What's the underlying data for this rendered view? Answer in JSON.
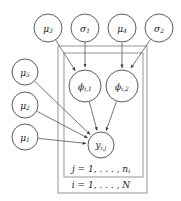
{
  "figure": {
    "type": "probabilistic-graphical-model",
    "title": "",
    "background_color": "#ffffff",
    "node_stroke_color": "#4a4a4a",
    "plate_stroke_color": "#8c8c8c",
    "edge_color": "#555555",
    "text_color": "#1a1a1a"
  },
  "nodes": [
    {
      "id": "mu3",
      "base": "μ",
      "sub": "3",
      "label": "μ₃",
      "cx": 48,
      "cy": 28,
      "r": 14,
      "shape": "circle",
      "observed": false
    },
    {
      "id": "sig1",
      "base": "σ",
      "sub": "1",
      "label": "σ₁",
      "cx": 85,
      "cy": 28,
      "r": 14,
      "shape": "circle",
      "observed": false
    },
    {
      "id": "mu4",
      "base": "μ",
      "sub": "4",
      "label": "μ₄",
      "cx": 122,
      "cy": 28,
      "r": 14,
      "shape": "circle",
      "observed": false
    },
    {
      "id": "sig2",
      "base": "σ",
      "sub": "2",
      "label": "σ₂",
      "cx": 159,
      "cy": 28,
      "r": 14,
      "shape": "circle",
      "observed": false
    },
    {
      "id": "mu5",
      "base": "μ",
      "sub": "5",
      "label": "μ₅",
      "cx": 25,
      "cy": 72,
      "r": 13,
      "shape": "circle",
      "observed": false
    },
    {
      "id": "mu2",
      "base": "μ",
      "sub": "2",
      "label": "μ₂",
      "cx": 25,
      "cy": 105,
      "r": 13,
      "shape": "circle",
      "observed": false
    },
    {
      "id": "mu1",
      "base": "μ",
      "sub": "1",
      "label": "μ₁",
      "cx": 25,
      "cy": 137,
      "r": 13,
      "shape": "circle",
      "observed": false
    },
    {
      "id": "phi1",
      "base": "ϕ",
      "sub": "i,1",
      "label": "ϕi,1",
      "cx": 85,
      "cy": 86,
      "r": 16,
      "shape": "circle",
      "observed": false
    },
    {
      "id": "phi2",
      "base": "ϕ",
      "sub": "i,2",
      "label": "ϕi,2",
      "cx": 122,
      "cy": 86,
      "r": 16,
      "shape": "circle",
      "observed": false
    },
    {
      "id": "y",
      "base": "y",
      "sub": "i,j",
      "label": "yi,j",
      "cx": 101,
      "cy": 145,
      "r": 13,
      "shape": "circle",
      "observed": false
    }
  ],
  "edges": [
    {
      "from": "mu3",
      "to": "phi1",
      "arrow": true
    },
    {
      "from": "sig1",
      "to": "phi1",
      "arrow": true
    },
    {
      "from": "mu4",
      "to": "phi2",
      "arrow": true
    },
    {
      "from": "sig2",
      "to": "phi2",
      "arrow": true
    },
    {
      "from": "mu5",
      "to": "y",
      "arrow": true
    },
    {
      "from": "mu2",
      "to": "y",
      "arrow": true
    },
    {
      "from": "mu1",
      "to": "y",
      "arrow": true
    },
    {
      "from": "phi1",
      "to": "y",
      "arrow": true
    },
    {
      "from": "phi2",
      "to": "y",
      "arrow": true
    }
  ],
  "plates": [
    {
      "id": "outer-plate",
      "x": 58,
      "y": 46,
      "width": 89,
      "height": 147,
      "label_prefix": "i = 1,",
      "label_dots": ". . . ,",
      "label_suffix": "N",
      "label_sub": "",
      "label_text": "i = 1, . . . , N",
      "label_x": 101,
      "label_y": 185
    },
    {
      "id": "inner-plate",
      "x": 64,
      "y": 53,
      "width": 79,
      "height": 124,
      "label_prefix": "j = 1,",
      "label_dots": ". . . ,",
      "label_suffix": "n",
      "label_sub": "i",
      "label_text": "j = 1, . . . , nᵢ",
      "label_x": 101,
      "label_y": 169
    }
  ]
}
